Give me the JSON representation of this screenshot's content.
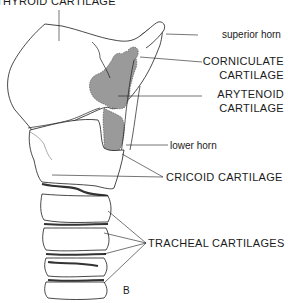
{
  "diagram": {
    "type": "anatomical-illustration",
    "panel_label": "B",
    "shading_color": "#9a9a9a",
    "line_color": "#1a1a1a",
    "labels": {
      "thyroid": "THYROID CARTILAGE",
      "superior_horn": "superior horn",
      "corniculate_1": "CORNICULATE",
      "corniculate_2": "CARTILAGE",
      "arytenoid_1": "ARYTENOID",
      "arytenoid_2": "CARTILAGE",
      "lower_horn": "lower horn",
      "cricoid": "CRICOID CARTILAGE",
      "tracheal": "TRACHEAL CARTILAGES"
    }
  }
}
